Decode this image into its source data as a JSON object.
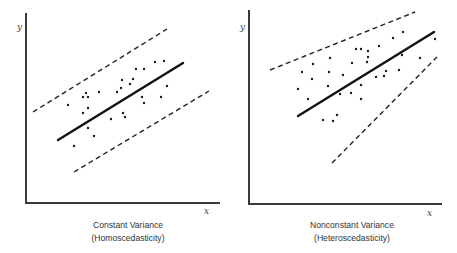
{
  "chart_data": [
    {
      "type": "scatter",
      "title": "Constant Variance",
      "subtitle": "(Homoscedasticity)",
      "xlabel": "x",
      "ylabel": "y",
      "grid": false,
      "legend": null,
      "axes_px": {
        "origin": [
          26,
          203
        ],
        "x_end": 220,
        "y_end": 13
      },
      "fit_line": {
        "from": [
          58,
          140
        ],
        "to": [
          183,
          63
        ]
      },
      "upper_band": {
        "from": [
          33,
          112
        ],
        "to": [
          167,
          29
        ]
      },
      "lower_band": {
        "from": [
          74,
          172
        ],
        "to": [
          209,
          91
        ]
      },
      "points": [
        [
          68,
          105
        ],
        [
          83,
          97
        ],
        [
          86,
          93
        ],
        [
          88,
          97
        ],
        [
          99,
          92
        ],
        [
          83,
          113
        ],
        [
          88,
          108
        ],
        [
          88,
          128
        ],
        [
          94,
          136
        ],
        [
          74,
          146
        ],
        [
          111,
          119
        ],
        [
          117,
          92
        ],
        [
          121,
          88
        ],
        [
          122,
          80
        ],
        [
          130,
          84
        ],
        [
          133,
          79
        ],
        [
          136,
          69
        ],
        [
          144,
          69
        ],
        [
          123,
          113
        ],
        [
          125,
          117
        ],
        [
          142,
          97
        ],
        [
          144,
          103
        ],
        [
          155,
          62
        ],
        [
          164,
          61
        ],
        [
          167,
          86
        ],
        [
          161,
          97
        ]
      ]
    },
    {
      "type": "scatter",
      "title": "Nonconstant Variance",
      "subtitle": "(Heteroscedasticity)",
      "xlabel": "x",
      "ylabel": "y",
      "grid": false,
      "legend": null,
      "axes_px": {
        "origin": [
          249,
          204
        ],
        "x_end": 442,
        "y_end": 10
      },
      "fit_line": {
        "from": [
          298,
          116
        ],
        "to": [
          434,
          32
        ]
      },
      "upper_band": {
        "from": [
          270,
          70
        ],
        "to": [
          415,
          12
        ]
      },
      "lower_band": {
        "from": [
          332,
          163
        ],
        "to": [
          437,
          57
        ]
      },
      "points": [
        [
          298,
          89
        ],
        [
          302,
          72
        ],
        [
          308,
          99
        ],
        [
          312,
          79
        ],
        [
          313,
          64
        ],
        [
          323,
          120
        ],
        [
          328,
          86
        ],
        [
          329,
          72
        ],
        [
          330,
          58
        ],
        [
          333,
          121
        ],
        [
          337,
          115
        ],
        [
          340,
          94
        ],
        [
          343,
          75
        ],
        [
          351,
          93
        ],
        [
          352,
          63
        ],
        [
          356,
          49
        ],
        [
          361,
          49
        ],
        [
          361,
          85
        ],
        [
          361,
          99
        ],
        [
          367,
          62
        ],
        [
          368,
          51
        ],
        [
          368,
          57
        ],
        [
          376,
          77
        ],
        [
          379,
          46
        ],
        [
          384,
          76
        ],
        [
          386,
          71
        ],
        [
          393,
          38
        ],
        [
          399,
          70
        ],
        [
          402,
          55
        ],
        [
          403,
          32
        ],
        [
          420,
          58
        ],
        [
          435,
          39
        ]
      ]
    }
  ],
  "left": {
    "title": "Constant Variance",
    "subtitle": "(Homoscedasticity)",
    "xlabel": "x",
    "ylabel": "y"
  },
  "right": {
    "title": "Nonconstant Variance",
    "subtitle": "(Heteroscedasticity)",
    "xlabel": "x",
    "ylabel": "y"
  }
}
